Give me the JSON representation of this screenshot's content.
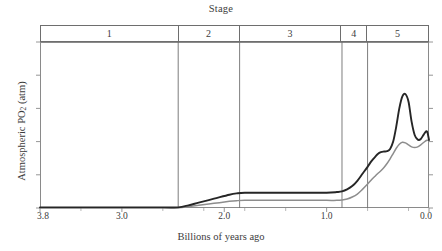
{
  "chart_data": {
    "type": "line",
    "title": "Stage",
    "xlabel": "Billions of years ago",
    "ylabel": "Atmospheric PO2 (atm)",
    "ylabel_parts": {
      "prefix": "Atmospheric PO",
      "sub": "2",
      "suffix": " (atm)"
    },
    "xlim": [
      3.8,
      0.0
    ],
    "ylim": [
      0.0,
      0.5
    ],
    "x_reversed": true,
    "grid": false,
    "legend": null,
    "xticks": [
      3.8,
      3.0,
      2.0,
      1.0,
      0.0
    ],
    "xtick_labels": [
      "3.8",
      "3.0",
      "2.0",
      "1.0",
      "0.0"
    ],
    "xminor_ticks": [
      3.4,
      2.6,
      2.2,
      1.8,
      1.4,
      0.6,
      0.2
    ],
    "yticks": [
      0.0,
      0.1,
      0.2,
      0.3,
      0.4,
      0.5
    ],
    "ytick_labels": [
      "0.0",
      "0.1",
      "0.2",
      "0.3",
      "0.4",
      "0.5"
    ],
    "stages": [
      {
        "label": "1",
        "start": 3.8,
        "end": 2.45
      },
      {
        "label": "2",
        "start": 2.45,
        "end": 1.85
      },
      {
        "label": "3",
        "start": 1.85,
        "end": 0.85
      },
      {
        "label": "4",
        "start": 0.85,
        "end": 0.6
      },
      {
        "label": "5",
        "start": 0.6,
        "end": 0.0
      }
    ],
    "series": [
      {
        "name": "upper-bound",
        "color": "#262626",
        "width": 1.9,
        "x": [
          3.8,
          3.0,
          2.6,
          2.45,
          2.35,
          2.25,
          2.1,
          1.95,
          1.88,
          1.8,
          1.6,
          1.4,
          1.2,
          1.0,
          0.9,
          0.85,
          0.8,
          0.75,
          0.7,
          0.65,
          0.6,
          0.56,
          0.52,
          0.5,
          0.47,
          0.44,
          0.41,
          0.38,
          0.35,
          0.32,
          0.29,
          0.26,
          0.23,
          0.2,
          0.17,
          0.14,
          0.11,
          0.08,
          0.05,
          0.02,
          0.0
        ],
        "y": [
          0.002,
          0.002,
          0.002,
          0.002,
          0.008,
          0.016,
          0.028,
          0.04,
          0.044,
          0.046,
          0.046,
          0.046,
          0.046,
          0.046,
          0.048,
          0.05,
          0.056,
          0.066,
          0.082,
          0.103,
          0.124,
          0.142,
          0.156,
          0.163,
          0.168,
          0.17,
          0.171,
          0.178,
          0.2,
          0.245,
          0.3,
          0.336,
          0.343,
          0.32,
          0.26,
          0.22,
          0.206,
          0.208,
          0.222,
          0.231,
          0.205
        ]
      },
      {
        "name": "lower-bound",
        "color": "#8d8d8d",
        "width": 1.5,
        "x": [
          3.8,
          3.0,
          2.6,
          2.45,
          2.35,
          2.25,
          2.1,
          1.95,
          1.88,
          1.8,
          1.6,
          1.4,
          1.2,
          1.0,
          0.9,
          0.85,
          0.8,
          0.75,
          0.7,
          0.65,
          0.6,
          0.56,
          0.52,
          0.5,
          0.47,
          0.44,
          0.41,
          0.38,
          0.35,
          0.32,
          0.29,
          0.26,
          0.23,
          0.2,
          0.17,
          0.14,
          0.11,
          0.08,
          0.05,
          0.02,
          0.0
        ],
        "y": [
          0.001,
          0.001,
          0.001,
          0.001,
          0.004,
          0.008,
          0.014,
          0.02,
          0.022,
          0.023,
          0.023,
          0.023,
          0.023,
          0.023,
          0.023,
          0.024,
          0.027,
          0.033,
          0.042,
          0.056,
          0.072,
          0.086,
          0.098,
          0.104,
          0.112,
          0.122,
          0.134,
          0.148,
          0.164,
          0.18,
          0.192,
          0.198,
          0.196,
          0.19,
          0.184,
          0.182,
          0.184,
          0.19,
          0.198,
          0.204,
          0.203
        ]
      }
    ]
  }
}
